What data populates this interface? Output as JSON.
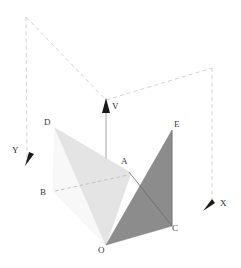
{
  "figure": {
    "background_color": "#ffffff",
    "width": 241,
    "height": 268
  },
  "axes": [
    {
      "name": "v-axis",
      "label": "V",
      "label_x": 111,
      "label_y": 103,
      "direction": "up"
    },
    {
      "name": "y-axis",
      "label": "Y",
      "label_x": 12,
      "label_y": 147,
      "direction": "down-left"
    },
    {
      "name": "x-axis",
      "label": "X",
      "label_x": 220,
      "label_y": 200,
      "direction": "down-left"
    }
  ],
  "points": [
    {
      "name": "A",
      "label": "A",
      "label_x": 121,
      "label_y": 157,
      "x": 130,
      "y": 172
    },
    {
      "name": "B",
      "label": "B",
      "label_x": 40,
      "label_y": 189,
      "x": 53,
      "y": 191
    },
    {
      "name": "C",
      "label": "C",
      "label_x": 171,
      "label_y": 226,
      "x": 172,
      "y": 226
    },
    {
      "name": "D",
      "label": "D",
      "label_x": 44,
      "label_y": 118,
      "x": 55,
      "y": 128
    },
    {
      "name": "E",
      "label": "E",
      "label_x": 173,
      "label_y": 121,
      "x": 172,
      "y": 130
    },
    {
      "name": "O",
      "label": "O",
      "label_x": 99,
      "label_y": 245,
      "x": 106,
      "y": 245
    }
  ],
  "shapes": [
    {
      "name": "light-triangle-DAO",
      "fill": "#e3e3e3",
      "points": "55,128 130,172 106,245"
    },
    {
      "name": "pale-triangle-DBO",
      "fill": "#f6f6f6",
      "points": "55,128 53,191 106,245"
    },
    {
      "name": "dark-triangle-OEC",
      "fill": "#8a8a8a",
      "points": "106,245 172,130 172,226"
    }
  ],
  "lines": [
    {
      "name": "line-A-C",
      "stroke": "#6a6a6a",
      "x1": 130,
      "y1": 172,
      "x2": 172,
      "y2": 226
    },
    {
      "name": "line-B-A",
      "stroke": "#b8b8b8",
      "dashed": true,
      "x1": 53,
      "y1": 191,
      "x2": 130,
      "y2": 172
    },
    {
      "name": "line-E-C",
      "stroke": "#777777",
      "x1": 172,
      "y1": 130,
      "x2": 172,
      "y2": 226
    }
  ],
  "bounding_box": {
    "name": "dashed-construction-box",
    "stroke": "#c9c9c9",
    "corner_top_left": [
      26,
      17
    ],
    "corner_apex": [
      106,
      100
    ],
    "corner_top_right": [
      212,
      68
    ],
    "y_arrow_tip": [
      27,
      163
    ],
    "x_arrow_tip": [
      208,
      208
    ]
  },
  "colors": {
    "dark_fill": "#8a8a8a",
    "light_fill": "#e3e3e3",
    "pale_fill": "#f6f6f6",
    "dashed_stroke": "#c9c9c9",
    "axis_stroke": "#7d7d7d",
    "label_text": "#3a3a3a"
  }
}
